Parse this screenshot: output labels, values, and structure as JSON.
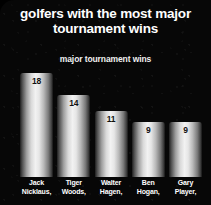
{
  "chart_data": {
    "type": "bar",
    "title": "golfers with the most major tournament wins",
    "title_line1": "golfers with the most major",
    "title_line2": "tournament wins",
    "subtitle": "major tournament wins",
    "xlabel": "",
    "ylabel": "major tournament wins",
    "ylim": [
      0,
      20
    ],
    "grid": false,
    "legend": "none",
    "categories": [
      "Jack Nicklaus,",
      "Tiger Woods,",
      "Walter Hagen,",
      "Ben Hogan,",
      "Gary Player,"
    ],
    "category_lines": [
      [
        "Jack",
        "Nicklaus,"
      ],
      [
        "Tiger",
        "Woods,"
      ],
      [
        "Walter",
        "Hagen,"
      ],
      [
        "Ben",
        "Hogan,"
      ],
      [
        "Gary",
        "Player,"
      ]
    ],
    "values": [
      18,
      14,
      11,
      9,
      9
    ],
    "value_labels": [
      "18",
      "14",
      "11",
      "9",
      "9"
    ],
    "bar_heights_px": [
      104,
      82,
      66,
      55,
      55
    ]
  },
  "colors": {
    "background": "#080808",
    "title_text": "#ffffff",
    "subtitle_text": "#f0f0f0",
    "bar_highlight": "#f2f2f2",
    "bar_shadow": "#141414",
    "value_text": "#111111",
    "category_text": "#ffffff"
  }
}
